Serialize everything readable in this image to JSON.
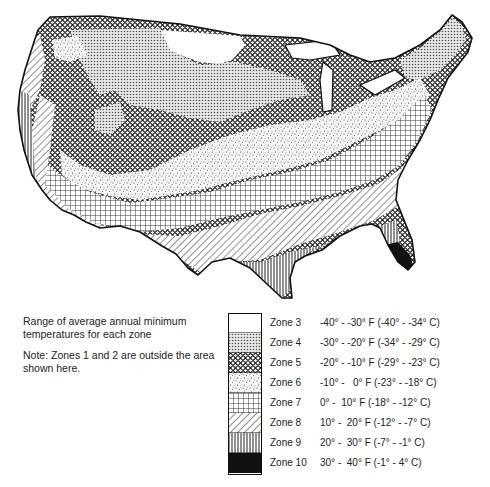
{
  "caption": {
    "description": "Range of average annual minimum temperatures for each zone",
    "note": "Note: Zones 1 and 2 are outside the area shown here."
  },
  "legend": {
    "zones": [
      {
        "label": "Zone 3",
        "range": "-40° - -30° F (-40° - -34° C)",
        "pattern": "blank",
        "color": "#ffffff"
      },
      {
        "label": "Zone 4",
        "range": "-30° - -20° F (-34° - -29° C)",
        "pattern": "fine-dots",
        "color": "#cfcfcf"
      },
      {
        "label": "Zone 5",
        "range": "-20° - -10° F (-29° - -23° C)",
        "pattern": "diamond-mesh",
        "color": "#9a9a9a"
      },
      {
        "label": "Zone 6",
        "range": "-10° -   0° F (-23° - -18° C)",
        "pattern": "stipple",
        "color": "#e2e2e2"
      },
      {
        "label": "Zone 7",
        "range": "0° -  10° F (-18° - -12° C)",
        "pattern": "square-grid",
        "color": "#f0f0f0"
      },
      {
        "label": "Zone 8",
        "range": "10° -  20° F (-12° - -7° C)",
        "pattern": "diagonal-hatch",
        "color": "#f0f0f0"
      },
      {
        "label": "Zone 9",
        "range": "20° -  30° F (-7° - -1° C)",
        "pattern": "vertical-lines",
        "color": "#bbbbbb"
      },
      {
        "label": "Zone 10",
        "range": "30° -  40° F (-1° - 4° C)",
        "pattern": "solid",
        "color": "#111111"
      }
    ]
  },
  "map": {
    "subject": "USDA plant hardiness zones, contiguous United States",
    "outline_color": "#111111"
  }
}
